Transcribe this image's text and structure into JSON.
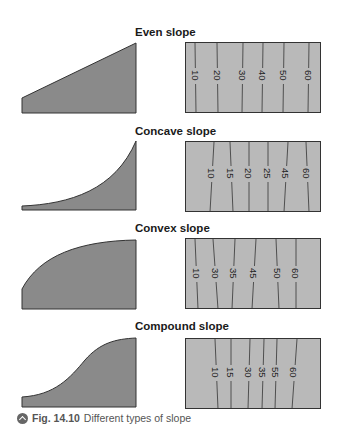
{
  "colors": {
    "profile_fill": "#8a8a8a",
    "map_fill": "#b9b9b9",
    "line": "#333333",
    "caption": "#555555"
  },
  "panels": [
    {
      "title": "Even slope",
      "type": "even",
      "contour_labels": [
        "10",
        "20",
        "30",
        "40",
        "50",
        "60"
      ]
    },
    {
      "title": "Concave slope",
      "type": "concave",
      "contour_labels": [
        "10",
        "15",
        "20",
        "25",
        "45",
        "60"
      ]
    },
    {
      "title": "Convex slope",
      "type": "convex",
      "contour_labels": [
        "10",
        "30",
        "35",
        "45",
        "50",
        "60"
      ]
    },
    {
      "title": "Compound slope",
      "type": "compound",
      "contour_labels": [
        "10",
        "15",
        "30",
        "35",
        "55",
        "60"
      ]
    }
  ],
  "caption": {
    "icon": "chevron-up-circle-icon",
    "figure_number": "Fig. 14.10",
    "text": "Different types of slope"
  }
}
